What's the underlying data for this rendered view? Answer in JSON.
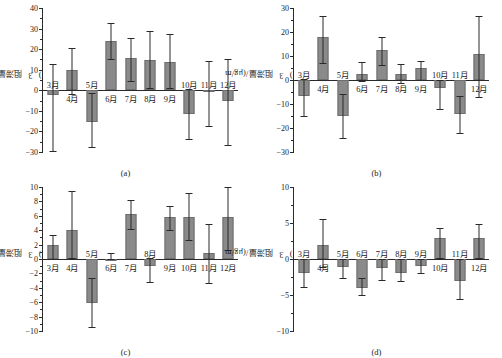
{
  "figure": {
    "y_axis_label_text": "阻滞量/(μg/m",
    "y_axis_label_exp": "3",
    "y_axis_label_tail": ")",
    "categories": [
      "3月",
      "4月",
      "5月",
      "6月",
      "7月",
      "8月",
      "9月",
      "10月",
      "11月",
      "12月"
    ]
  },
  "chart_data": [
    {
      "type": "bar",
      "caption": "(a)",
      "title": "",
      "xlabel": "",
      "ylabel": "阻滞量/(μg/m³)",
      "categories": [
        "3月",
        "4月",
        "5月",
        "6月",
        "7月",
        "8月",
        "9月",
        "10月",
        "11月",
        "12月"
      ],
      "values": [
        -2.5,
        10.0,
        -15.2,
        24.0,
        15.8,
        14.6,
        13.7,
        -11.5,
        -1.0,
        -5.0
      ],
      "err_low": [
        -29.5,
        -2.0,
        -27.5,
        15.2,
        4.5,
        1.0,
        1.2,
        -23.5,
        -17.5,
        -26.5
      ],
      "err_high": [
        13.0,
        20.5,
        -1.5,
        32.5,
        25.5,
        29.0,
        27.5,
        0.5,
        14.0,
        15.0
      ],
      "ylim": [
        -30,
        40
      ],
      "ytick_step": 10,
      "yticks": [
        40,
        30,
        20,
        10,
        0,
        -10,
        -20,
        -30
      ],
      "label_above_zero": [
        true,
        false,
        true,
        false,
        false,
        false,
        false,
        true,
        true,
        true
      ],
      "grid": false,
      "legend": "none"
    },
    {
      "type": "bar",
      "caption": "(b)",
      "title": "",
      "xlabel": "",
      "ylabel": "阻滞量/(μg/m³)",
      "categories": [
        "3月",
        "4月",
        "5月",
        "6月",
        "7月",
        "8月",
        "9月",
        "10月",
        "11月",
        "12月"
      ],
      "values": [
        -6.8,
        18.0,
        -15.0,
        2.7,
        12.5,
        2.6,
        4.8,
        -3.5,
        -14.0,
        10.8
      ],
      "err_low": [
        -14.8,
        7.0,
        -24.0,
        -0.5,
        6.2,
        -1.3,
        0.2,
        -12.2,
        -22.0,
        -7.0
      ],
      "err_high": [
        0.3,
        26.5,
        -6.0,
        7.5,
        18.0,
        6.5,
        7.8,
        0.2,
        -6.5,
        26.5
      ],
      "ylim": [
        -30,
        30
      ],
      "ytick_step": 10,
      "yticks": [
        30,
        20,
        10,
        0,
        -10,
        -20,
        -30
      ],
      "label_above_zero": [
        true,
        false,
        true,
        false,
        false,
        false,
        false,
        true,
        true,
        false
      ],
      "grid": false,
      "legend": "none"
    },
    {
      "type": "bar",
      "caption": "(c)",
      "title": "",
      "xlabel": "",
      "ylabel": "阻滞量/(μg/m³)",
      "categories": [
        "3月",
        "4月",
        "5月",
        "6月",
        "7月",
        "8月",
        "9月",
        "10月",
        "11月",
        "12月"
      ],
      "values": [
        2.0,
        4.0,
        -6.1,
        0.0,
        6.3,
        -1.0,
        5.9,
        5.9,
        0.9,
        5.9
      ],
      "err_low": [
        0.0,
        0.1,
        -9.4,
        0.0,
        4.1,
        -3.2,
        4.0,
        2.7,
        -3.4,
        1.2
      ],
      "err_high": [
        3.4,
        9.4,
        -2.6,
        0.9,
        8.2,
        0.2,
        7.3,
        9.1,
        4.9,
        10.0
      ],
      "ylim": [
        -10,
        10
      ],
      "ytick_step": 2,
      "yticks": [
        10,
        8,
        6,
        4,
        2,
        0,
        -2,
        -4,
        -6,
        -8,
        -10
      ],
      "label_above_zero": [
        false,
        false,
        true,
        false,
        false,
        true,
        false,
        false,
        false,
        false
      ],
      "grid": false,
      "legend": "none"
    },
    {
      "type": "bar",
      "caption": "(d)",
      "title": "",
      "xlabel": "",
      "ylabel": "阻滞量/(μg/m³)",
      "categories": [
        "3月",
        "4月",
        "5月",
        "6月",
        "7月",
        "8月",
        "9月",
        "10月",
        "11月",
        "12月"
      ],
      "values": [
        -2.0,
        2.0,
        -1.1,
        -4.0,
        -1.2,
        -2.0,
        -1.0,
        2.9,
        -3.1,
        2.9
      ],
      "err_low": [
        -3.9,
        -1.1,
        -2.6,
        -5.0,
        -2.9,
        -3.1,
        -1.9,
        0.2,
        -5.6,
        0.2
      ],
      "err_high": [
        0.0,
        5.6,
        0.0,
        -2.6,
        0.0,
        0.0,
        0.0,
        4.3,
        0.0,
        4.9
      ],
      "ylim": [
        -10,
        10
      ],
      "ytick_step": 5,
      "yticks": [
        10,
        5,
        0,
        -5,
        -10
      ],
      "label_above_zero": [
        true,
        false,
        true,
        true,
        true,
        true,
        true,
        false,
        true,
        false
      ],
      "grid": false,
      "legend": "none"
    }
  ]
}
